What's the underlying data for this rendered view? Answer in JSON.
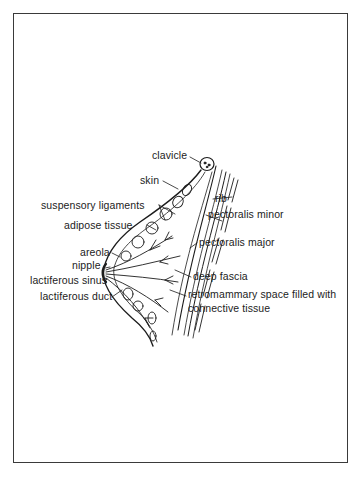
{
  "figure": {
    "labels_left": [
      {
        "id": "clavicle",
        "text": "clavicle"
      },
      {
        "id": "skin",
        "text": "skin"
      },
      {
        "id": "suspensory_ligaments",
        "text": "suspensory ligaments"
      },
      {
        "id": "adipose_tissue",
        "text": "adipose tissue"
      },
      {
        "id": "areola",
        "text": "areola"
      },
      {
        "id": "nipple",
        "text": "nipple"
      },
      {
        "id": "lactiferous_sinus",
        "text": "lactiferous sinus"
      },
      {
        "id": "lactiferous_duct",
        "text": "lactiferous duct"
      }
    ],
    "labels_right": [
      {
        "id": "rib",
        "text": "rib"
      },
      {
        "id": "pectoralis_minor",
        "text": "pectoralis minor"
      },
      {
        "id": "pectoralis_major",
        "text": "pectoralis major"
      },
      {
        "id": "deep_fascia",
        "text": "deep fascia"
      },
      {
        "id": "retromammary_line1",
        "text": "retromammary space filled with"
      },
      {
        "id": "retromammary_line2",
        "text": "connective tissue"
      }
    ]
  },
  "colors": {
    "ink": "#1c1c1c",
    "frame": "#3a3a3a",
    "background": "#ffffff"
  }
}
